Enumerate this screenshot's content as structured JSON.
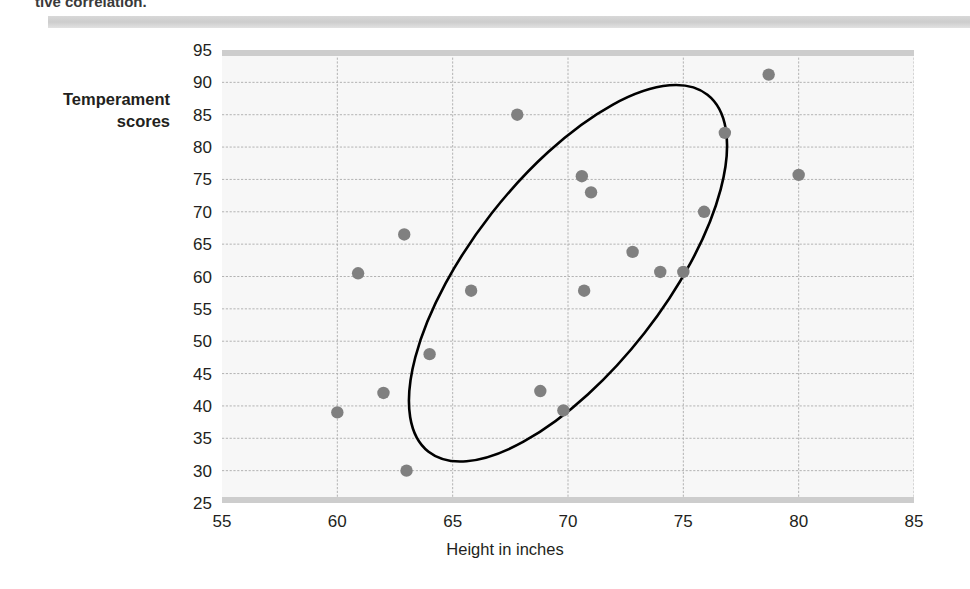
{
  "caption": {
    "text": "tive correlation."
  },
  "chart_data": {
    "type": "scatter",
    "title": "",
    "xlabel": "Height in inches",
    "ylabel": "Temperament scores",
    "ylabel_lines": [
      "Temperament",
      "scores"
    ],
    "xlim": [
      55,
      85
    ],
    "ylim": [
      25,
      95
    ],
    "xticks": [
      55,
      60,
      65,
      70,
      75,
      80,
      85
    ],
    "yticks": [
      25,
      30,
      35,
      40,
      45,
      50,
      55,
      60,
      65,
      70,
      75,
      80,
      85,
      90,
      95
    ],
    "grid": true,
    "legend": "none",
    "point_color": "#808080",
    "ellipse_color": "#000000",
    "plot_background": "#f7f7f7",
    "gridline_color": "#b3b3b3",
    "axis_band_color": "#cdcdcd",
    "points": [
      {
        "x": 60.0,
        "y": 39.0
      },
      {
        "x": 60.9,
        "y": 60.5
      },
      {
        "x": 62.0,
        "y": 42.0
      },
      {
        "x": 63.0,
        "y": 30.0
      },
      {
        "x": 62.9,
        "y": 66.5
      },
      {
        "x": 64.0,
        "y": 48.0
      },
      {
        "x": 65.8,
        "y": 57.8
      },
      {
        "x": 67.8,
        "y": 85.0
      },
      {
        "x": 68.8,
        "y": 42.3
      },
      {
        "x": 69.8,
        "y": 39.3
      },
      {
        "x": 70.6,
        "y": 75.5
      },
      {
        "x": 70.7,
        "y": 57.8
      },
      {
        "x": 71.0,
        "y": 73.0
      },
      {
        "x": 72.8,
        "y": 63.8
      },
      {
        "x": 74.0,
        "y": 60.7
      },
      {
        "x": 75.0,
        "y": 60.7
      },
      {
        "x": 75.9,
        "y": 70.0
      },
      {
        "x": 76.8,
        "y": 82.2
      },
      {
        "x": 78.7,
        "y": 91.2
      },
      {
        "x": 80.0,
        "y": 75.7
      }
    ],
    "ellipse": {
      "center_x": 70.0,
      "center_y": 60.5,
      "semi_major": 35.0,
      "semi_minor": 15.0,
      "rotation_deg": -52
    }
  }
}
